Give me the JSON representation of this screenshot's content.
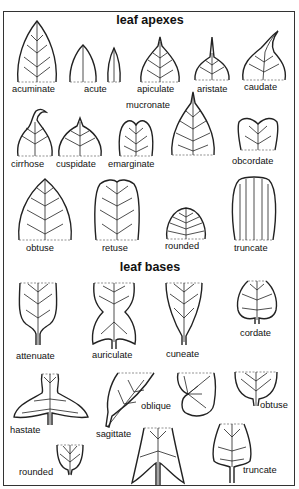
{
  "sections": {
    "apexes": {
      "title": "leaf apexes",
      "items": [
        "acuminate",
        "acute",
        "apiculate",
        "aristate",
        "caudate",
        "mucronate",
        "cirrhose",
        "cuspidate",
        "emarginate",
        "obcordate",
        "obtuse",
        "retuse",
        "rounded",
        "truncate"
      ]
    },
    "bases": {
      "title": "leaf bases",
      "items": [
        "attenuate",
        "auriculate",
        "cuneate",
        "cordate",
        "hastate",
        "oblique",
        "obtuse",
        "sagittate",
        "rounded",
        "truncate"
      ]
    }
  }
}
